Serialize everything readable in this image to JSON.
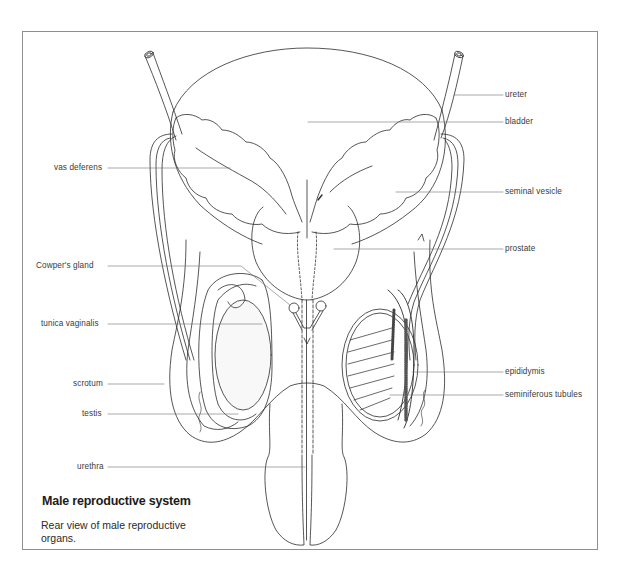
{
  "figure": {
    "title": "Male reproductive system",
    "description": "Rear view of male reproductive organs."
  },
  "labels": {
    "ureter": "ureter",
    "bladder": "bladder",
    "vas_deferens": "vas deferens",
    "seminal_vesicle": "seminal vesicle",
    "prostate": "prostate",
    "cowpers_gland": "Cowper's gland",
    "tunica_vaginalis": "tunica vaginalis",
    "epididymis": "epididymis",
    "scrotum": "scrotum",
    "seminiferous_tubules": "seminiferous tubules",
    "testis": "testis",
    "urethra": "urethra"
  },
  "colors": {
    "line": "#2b2b2b",
    "leader": "#6e6e6e",
    "frame": "#8f8f8f",
    "background": "#ffffff"
  }
}
